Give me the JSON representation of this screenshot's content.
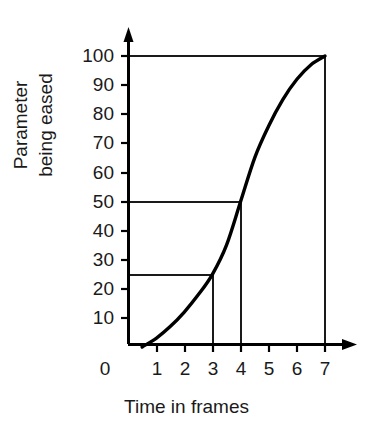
{
  "chart_data": {
    "type": "line",
    "title": "",
    "subtitle": "",
    "xlabel": "Time in frames",
    "ylabel_lines": [
      "Parameter",
      "being eased"
    ],
    "ylabel": "Parameter being eased",
    "xlim": [
      0,
      7.6
    ],
    "ylim": [
      0,
      107
    ],
    "xticks": [
      0,
      1,
      2,
      3,
      4,
      5,
      6,
      7
    ],
    "xtick_labels": [
      "0",
      "1",
      "2",
      "3",
      "4",
      "5",
      "6",
      "7"
    ],
    "yticks": [
      10,
      20,
      30,
      40,
      50,
      60,
      70,
      80,
      90,
      100
    ],
    "ytick_labels": [
      "10",
      "20",
      "30",
      "40",
      "50",
      "60",
      "70",
      "80",
      "90",
      "100"
    ],
    "grid": false,
    "legend": null,
    "axis_arrows": true,
    "series": [
      {
        "name": "eased parameter",
        "color": "#000000",
        "linewidth": 3,
        "x": [
          0.5,
          1.0,
          1.5,
          2.0,
          2.5,
          3.0,
          3.5,
          4.0,
          4.5,
          5.0,
          5.5,
          6.0,
          6.5,
          7.0
        ],
        "y": [
          0,
          3,
          7,
          12,
          18,
          25,
          35,
          50,
          65,
          76,
          85,
          92,
          97,
          100
        ]
      }
    ],
    "annotations": [
      {
        "name": "guide-25-at-frame-3",
        "type": "guide-lines",
        "x": 3,
        "y": 25,
        "label": "25 at frame 3"
      },
      {
        "name": "guide-50-at-frame-4",
        "type": "guide-lines",
        "x": 4,
        "y": 50,
        "label": "50 at frame 4"
      },
      {
        "name": "guide-100-at-frame-7",
        "type": "guide-lines",
        "x": 7,
        "y": 100,
        "label": "100 at frame 7"
      }
    ]
  },
  "colors": {
    "curve": "#000000",
    "axis": "#000000",
    "guide": "#1a1a1a",
    "text": "#1a1a1a",
    "background": "#ffffff"
  }
}
